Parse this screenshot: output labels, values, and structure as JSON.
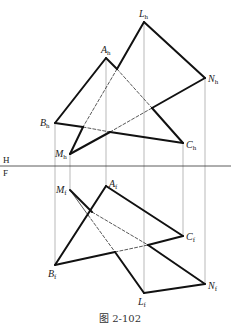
{
  "figure": {
    "caption": "图 2-102",
    "plane_labels": {
      "upper": "H",
      "lower": "F"
    },
    "upper_view": {
      "points": {
        "A": {
          "label": "A",
          "sub": "h",
          "x": 106,
          "y": 58
        },
        "B": {
          "label": "B",
          "sub": "h",
          "x": 55,
          "y": 123
        },
        "C": {
          "label": "C",
          "sub": "h",
          "x": 183,
          "y": 143
        },
        "L": {
          "label": "L",
          "sub": "h",
          "x": 144,
          "y": 22
        },
        "M": {
          "label": "M",
          "sub": "h",
          "x": 70,
          "y": 154
        },
        "N": {
          "label": "N",
          "sub": "h",
          "x": 205,
          "y": 78
        }
      }
    },
    "lower_view": {
      "points": {
        "A": {
          "label": "A",
          "sub": "f",
          "x": 106,
          "y": 186
        },
        "B": {
          "label": "B",
          "sub": "f",
          "x": 55,
          "y": 265
        },
        "C": {
          "label": "C",
          "sub": "f",
          "x": 183,
          "y": 236
        },
        "L": {
          "label": "L",
          "sub": "f",
          "x": 144,
          "y": 293
        },
        "M": {
          "label": "M",
          "sub": "f",
          "x": 70,
          "y": 190
        },
        "N": {
          "label": "N",
          "sub": "f",
          "x": 205,
          "y": 284
        }
      }
    },
    "colors": {
      "stroke": "#111111",
      "projection": "#888888"
    }
  }
}
